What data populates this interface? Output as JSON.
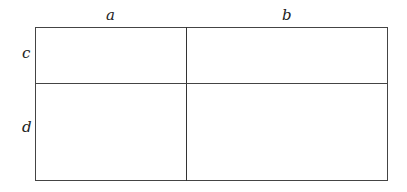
{
  "diagram": {
    "column_labels": [
      "a",
      "b"
    ],
    "row_labels": [
      "c",
      "d"
    ],
    "grid": {
      "rows": 2,
      "columns": 2,
      "cells": [
        [
          "",
          ""
        ],
        [
          "",
          ""
        ]
      ]
    },
    "line_color": "#444444"
  }
}
